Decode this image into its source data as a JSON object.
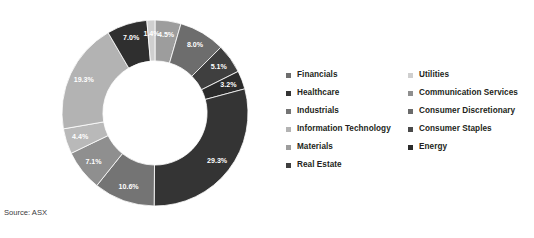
{
  "source_note": "Source: ASX",
  "chart_data": {
    "type": "pie",
    "variant": "donut",
    "title": "",
    "subtitle": "",
    "xlabel": "",
    "ylabel": "",
    "legend_position": "right",
    "legend_columns": 2,
    "grid": false,
    "start_angle_deg": 0,
    "direction": "clockwise",
    "inner_radius_ratio": 0.56,
    "value_unit": "%",
    "value_label_format": "0.0%",
    "total": 100.0,
    "categories": [
      "Materials",
      "Financials",
      "Real Estate",
      "Energy",
      "Healthcare",
      "Industrials",
      "Consumer Discretionary",
      "Consumer Staples",
      "Information Technology",
      "Communication Services",
      "Utilities"
    ],
    "values": [
      4.5,
      8.0,
      5.1,
      3.2,
      29.3,
      10.6,
      7.1,
      4.4,
      19.3,
      7.0,
      1.4
    ],
    "value_labels": [
      "4.5%",
      "8.0%",
      "5.1%",
      "3.2%",
      "29.3%",
      "10.6%",
      "7.1%",
      "4.4%",
      "19.3%",
      "7.0%",
      "1.4%"
    ],
    "colors": [
      "#9d9d9d",
      "#6d6d6d",
      "#3f3f3f",
      "#2b2b2b",
      "#343434",
      "#747474",
      "#8f8f8f",
      "#b9b9b9",
      "#b3b3b3",
      "#2f2f2f",
      "#cfcfcf"
    ],
    "slices": [
      {
        "label": "Materials",
        "value": 4.5,
        "value_label": "4.5%",
        "color": "#9d9d9d"
      },
      {
        "label": "Financials",
        "value": 8.0,
        "value_label": "8.0%",
        "color": "#6d6d6d"
      },
      {
        "label": "Real Estate",
        "value": 5.1,
        "value_label": "5.1%",
        "color": "#3f3f3f"
      },
      {
        "label": "Energy",
        "value": 3.2,
        "value_label": "3.2%",
        "color": "#2b2b2b"
      },
      {
        "label": "Healthcare",
        "value": 29.3,
        "value_label": "29.3%",
        "color": "#343434"
      },
      {
        "label": "Industrials",
        "value": 10.6,
        "value_label": "10.6%",
        "color": "#747474"
      },
      {
        "label": "Consumer Discretionary",
        "value": 7.1,
        "value_label": "7.1%",
        "color": "#8f8f8f"
      },
      {
        "label": "Consumer Staples",
        "value": 4.4,
        "value_label": "4.4%",
        "color": "#b9b9b9"
      },
      {
        "label": "Information Technology",
        "value": 19.3,
        "value_label": "19.3%",
        "color": "#b3b3b3"
      },
      {
        "label": "Communication Services",
        "value": 7.0,
        "value_label": "7.0%",
        "color": "#2f2f2f"
      },
      {
        "label": "Utilities",
        "value": 1.4,
        "value_label": "1.4%",
        "color": "#cfcfcf"
      }
    ]
  },
  "legend": {
    "columns": [
      {
        "items": [
          {
            "label": "Financials",
            "color": "#6d6d6d"
          },
          {
            "label": "Healthcare",
            "color": "#343434"
          },
          {
            "label": "Industrials",
            "color": "#747474"
          },
          {
            "label": "Information Technology",
            "color": "#b3b3b3"
          },
          {
            "label": "Materials",
            "color": "#9d9d9d"
          },
          {
            "label": "Real Estate",
            "color": "#3f3f3f"
          }
        ]
      },
      {
        "items": [
          {
            "label": "Utilities",
            "color": "#cfcfcf"
          },
          {
            "label": "Communication Services",
            "color": "#8f8f8f"
          },
          {
            "label": "Consumer Discretionary",
            "color": "#6a6a6a"
          },
          {
            "label": "Consumer Staples",
            "color": "#4a4a4a"
          },
          {
            "label": "Energy",
            "color": "#2b2b2b"
          }
        ]
      }
    ]
  }
}
